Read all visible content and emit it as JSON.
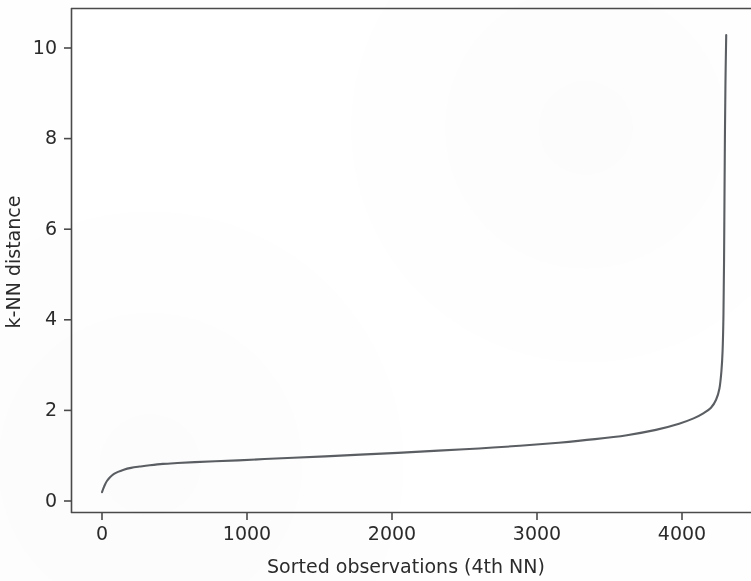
{
  "chart_data": {
    "type": "line",
    "title": "",
    "subtitle": "",
    "xlabel": "Sorted observations (4th NN)",
    "ylabel": "k-NN distance",
    "xlim": [
      -214,
      4476
    ],
    "ylim": [
      -0.26,
      11.16
    ],
    "xticks": [
      0,
      1000,
      2000,
      3000,
      4000
    ],
    "xticklabels": [
      "0",
      "1000",
      "2000",
      "3000",
      "4000"
    ],
    "yticks": [
      0,
      2,
      4,
      6,
      8,
      10
    ],
    "yticklabels": [
      "0",
      "2",
      "4",
      "6",
      "8",
      "10"
    ],
    "grid": false,
    "legend": null,
    "line_color": "#5b5f63",
    "line_width": 2.1,
    "series": [
      {
        "name": "4th nearest-neighbour distance",
        "x": [
          0,
          10,
          20,
          35,
          55,
          80,
          110,
          150,
          200,
          260,
          330,
          420,
          520,
          640,
          780,
          940,
          1120,
          1320,
          1540,
          1780,
          2040,
          2320,
          2600,
          2880,
          3150,
          3400,
          3620,
          3820,
          3980,
          4080,
          4150,
          4200,
          4235,
          4258,
          4272,
          4280,
          4286,
          4290,
          4293,
          4296,
          4300,
          4305
        ],
        "y": [
          0.21,
          0.3,
          0.38,
          0.47,
          0.55,
          0.62,
          0.67,
          0.72,
          0.76,
          0.79,
          0.82,
          0.85,
          0.87,
          0.89,
          0.91,
          0.93,
          0.96,
          0.99,
          1.02,
          1.06,
          1.1,
          1.15,
          1.2,
          1.26,
          1.33,
          1.41,
          1.5,
          1.62,
          1.76,
          1.88,
          2.0,
          2.12,
          2.3,
          2.55,
          2.95,
          3.4,
          4.2,
          5.4,
          6.8,
          8.2,
          9.5,
          10.55
        ]
      }
    ]
  },
  "axes": {
    "spine_color": "#4a4a4a",
    "text_color": "#2b2b2b"
  }
}
